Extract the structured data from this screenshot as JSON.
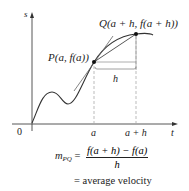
{
  "diagram": {
    "axes": {
      "vertical_label": "s",
      "horizontal_label": "t",
      "origin_label": "0"
    },
    "points": {
      "P": {
        "label": "P(a, f(a))"
      },
      "Q": {
        "label": "Q(a + h, f(a + h))"
      }
    },
    "ticks": {
      "a": "a",
      "a_plus_h": "a + h"
    },
    "interval_label": "h",
    "formula": {
      "lhs_main": "m",
      "lhs_sub": "PQ",
      "equals": "=",
      "numerator": "f(a + h) − f(a)",
      "denominator": "h",
      "second_line": "= average velocity"
    },
    "colors": {
      "stroke": "#333333",
      "dashed": "#aaaaaa",
      "background": "#ffffff"
    }
  }
}
